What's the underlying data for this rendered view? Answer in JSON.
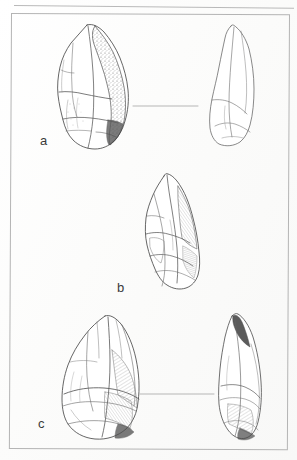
{
  "figure": {
    "kind": "archaeological-lithic-illustration-plate",
    "background_color": "#fdfdfd",
    "ink_color": "#4a4a4a",
    "frame_color": "#b4b4b4",
    "rule_color": "#b9b9b9",
    "items": [
      {
        "label": "a",
        "views": [
          "dorsal-face",
          "lateral-profile"
        ],
        "connector": true,
        "description": "handaxe / biface with cortical and stippled flaked surface"
      },
      {
        "label": "b",
        "views": [
          "dorsal-face"
        ],
        "connector": false,
        "description": "pointed core-tool with prominent flake scars"
      },
      {
        "label": "c",
        "views": [
          "dorsal-face",
          "lateral-profile"
        ],
        "connector": true,
        "description": "elongated pointed biface with hatched shading"
      }
    ],
    "labels": {
      "a": "a",
      "b": "b",
      "c": "c"
    }
  }
}
